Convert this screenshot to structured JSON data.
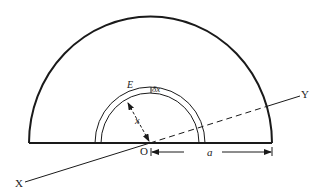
{
  "diagram": {
    "labels": {
      "X": "X",
      "Y": "Y",
      "O": "O",
      "E": "E",
      "dx": "δx",
      "x": "x",
      "a": "a"
    },
    "geometry": {
      "center": [
        150,
        143
      ],
      "outer_radius": 124,
      "strip_inner_radius": 50,
      "strip_outer_radius": 56,
      "axis_start": [
        25,
        182
      ],
      "axis_end": [
        300,
        96
      ]
    },
    "colors": {
      "stroke": "#1a1a1a",
      "background": "#ffffff"
    }
  }
}
